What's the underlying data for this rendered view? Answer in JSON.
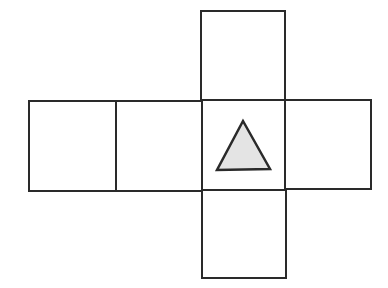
{
  "diagram": {
    "type": "cube-net",
    "stroke_color": "#2a2a2a",
    "fill_color": "#ffffff",
    "shape_fill": "#e4e4e4",
    "faces": [
      {
        "id": "top",
        "x": 201,
        "y": 11,
        "w": 84,
        "h": 90
      },
      {
        "id": "left-outer",
        "x": 29,
        "y": 101,
        "w": 87,
        "h": 90
      },
      {
        "id": "left-inner",
        "x": 116,
        "y": 101,
        "w": 86,
        "h": 90
      },
      {
        "id": "center",
        "x": 202,
        "y": 100,
        "w": 83,
        "h": 90
      },
      {
        "id": "right",
        "x": 285,
        "y": 100,
        "w": 86,
        "h": 89
      },
      {
        "id": "bottom",
        "x": 202,
        "y": 190,
        "w": 84,
        "h": 88
      }
    ],
    "marked_face": "center",
    "marker": {
      "shape": "triangle",
      "points": "243,121 217,170 270,169"
    }
  }
}
